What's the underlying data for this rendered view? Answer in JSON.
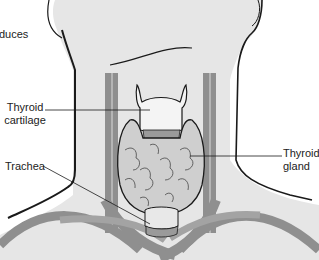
{
  "figure": {
    "colors": {
      "skin": "#e6e6e6",
      "outline": "#1a1a1a",
      "vessel": "#8f8f8f",
      "vessel_dark": "#6e6e6e",
      "gland": "#cfcfcf",
      "cartilage": "#f4f4f4",
      "background": "#ffffff"
    },
    "labels": {
      "partial_text": "duces",
      "thyroid_cartilage_line1": "Thyroid",
      "thyroid_cartilage_line2": "cartilage",
      "trachea": "Trachea",
      "thyroid_gland_line1": "Thyroid",
      "thyroid_gland_line2": "gland"
    }
  }
}
